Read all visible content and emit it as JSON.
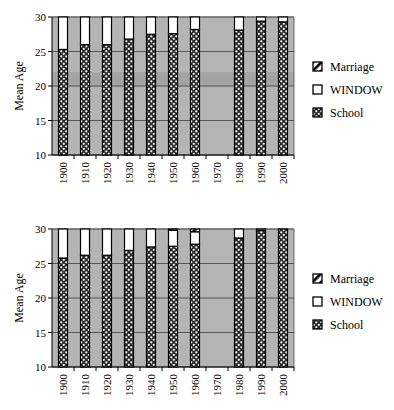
{
  "chart_data": [
    {
      "type": "bar",
      "stacked": true,
      "title": "",
      "xlabel": "",
      "ylabel": "Mean Age",
      "ylim": [
        10,
        30
      ],
      "yticks": [
        10,
        15,
        20,
        25,
        30
      ],
      "grid": true,
      "background_band": [
        20,
        22
      ],
      "legend_position": "right",
      "categories": [
        "1900",
        "1910",
        "1920",
        "1930",
        "1940",
        "1950",
        "1960",
        "1970",
        "1980",
        "1990",
        "2000"
      ],
      "series": [
        {
          "name": "School",
          "pattern": "dotted",
          "values": [
            15.3,
            16.0,
            16.0,
            16.8,
            17.5,
            17.6,
            18.2,
            null,
            18.1,
            19.4,
            19.3
          ]
        },
        {
          "name": "WINDOW",
          "pattern": "white",
          "values": [
            10.5,
            9.5,
            9.0,
            7.5,
            6.8,
            4.9,
            3.8,
            null,
            5.8,
            6.7,
            7.7
          ]
        },
        {
          "name": "Marriage",
          "pattern": "diagonal-hatch",
          "values": [
            4.2,
            4.5,
            5.0,
            5.7,
            5.7,
            7.5,
            8.0,
            null,
            6.1,
            3.9,
            3.0
          ]
        }
      ],
      "legend": [
        "Marriage",
        "WINDOW",
        "School"
      ]
    },
    {
      "type": "bar",
      "stacked": true,
      "title": "",
      "xlabel": "",
      "ylabel": "Mean Age",
      "ylim": [
        10,
        30
      ],
      "yticks": [
        10,
        15,
        20,
        25,
        30
      ],
      "grid": true,
      "legend_position": "right",
      "categories": [
        "1900",
        "1910",
        "1920",
        "1930",
        "1940",
        "1950",
        "1960",
        "1970",
        "1980",
        "1990",
        "2000"
      ],
      "series": [
        {
          "name": "School",
          "pattern": "dotted",
          "values": [
            15.8,
            16.2,
            16.2,
            16.9,
            17.4,
            17.5,
            17.8,
            null,
            18.7,
            19.8,
            20.7
          ]
        },
        {
          "name": "WINDOW",
          "pattern": "white",
          "values": [
            6.2,
            5.5,
            5.1,
            4.4,
            4.0,
            2.3,
            1.8,
            null,
            2.9,
            3.9,
            4.5
          ]
        },
        {
          "name": "Marriage",
          "pattern": "diagonal-hatch",
          "values": [
            8.0,
            8.3,
            8.7,
            8.7,
            8.6,
            10.2,
            10.4,
            null,
            8.4,
            6.3,
            4.8
          ]
        }
      ],
      "legend": [
        "Marriage",
        "WINDOW",
        "School"
      ]
    }
  ],
  "charts": {
    "top": {
      "ylabel": "Mean Age",
      "yticks": [
        "30",
        "25",
        "20",
        "15",
        "10"
      ],
      "legend": {
        "marriage": "Marriage",
        "window": "WINDOW",
        "school": "School"
      }
    },
    "bottom": {
      "ylabel": "Mean Age",
      "yticks": [
        "30",
        "25",
        "20",
        "15",
        "10"
      ],
      "legend": {
        "marriage": "Marriage",
        "window": "WINDOW",
        "school": "School"
      }
    }
  },
  "colors": {
    "plot_background": "#b4b4b4",
    "plot_band": "#a4a4a4",
    "grid": "#555555",
    "bar_outline": "#000000",
    "window_fill": "#ffffff"
  }
}
